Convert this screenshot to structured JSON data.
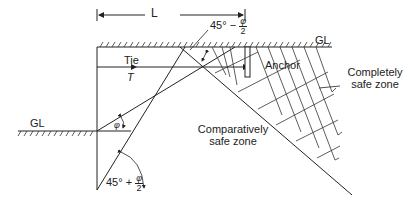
{
  "diagram": {
    "type": "anchored sheet pile wall - safe zones for anchor",
    "dimension": {
      "label": "L"
    },
    "ground_levels": {
      "top": "GL",
      "left": "GL"
    },
    "tie": {
      "label": "Tie",
      "force": "T"
    },
    "anchor": {
      "label": "Anchor"
    },
    "zones": {
      "completely_safe_line1": "Completely",
      "completely_safe_line2": "safe zone",
      "comparatively_safe_line1": "Comparatively",
      "comparatively_safe_line2": "safe zone"
    },
    "angles": {
      "top_prefix": "45° −",
      "top_num": "φ",
      "top_den": "2",
      "phi": "φ",
      "bottom_prefix": "45° +",
      "bottom_num": "φ",
      "bottom_den": "2"
    }
  }
}
